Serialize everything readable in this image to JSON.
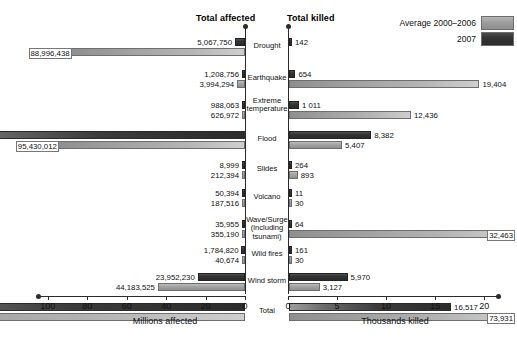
{
  "headers": {
    "affected": "Total affected",
    "killed": "Total killed"
  },
  "legend": {
    "position": "top-right",
    "items": [
      {
        "label": "Average 2000–2006",
        "key": "avg",
        "color": "#9d9d9d"
      },
      {
        "label": "2007",
        "key": "y2007",
        "color": "#333333"
      }
    ]
  },
  "axes": {
    "left": {
      "title": "Millions affected",
      "ticks": [
        "100",
        "80",
        "60",
        "40",
        "20",
        "0"
      ],
      "tick_values": [
        100,
        80,
        60,
        40,
        20,
        0
      ],
      "max": 105,
      "direction": "right-to-left"
    },
    "right": {
      "title": "Thousands killed",
      "ticks": [
        "0",
        "5",
        "10",
        "15",
        "20"
      ],
      "tick_values": [
        0,
        5,
        10,
        15,
        20
      ],
      "max": 21.5,
      "direction": "left-to-right"
    }
  },
  "chart_data": {
    "type": "bar",
    "orientation": "horizontal-bidirectional",
    "categories": [
      "Drought",
      "Earthquake",
      "Extreme temperature",
      "Flood",
      "Slides",
      "Volcano",
      "Wave/Surge (including tsunami)",
      "Wild fires",
      "Wind storm",
      "Total"
    ],
    "panels": [
      {
        "name": "Total affected",
        "xlabel": "Millions affected",
        "unit": "people",
        "xlim": [
          0,
          105
        ],
        "axis_unit_scale": 1000000,
        "series": [
          {
            "name": "2007",
            "key": "y2007",
            "values": [
              5067750,
              1208756,
              988063,
              164662775,
              8999,
              50394,
              35955,
              1784820,
              23952230,
              197760311
            ],
            "labels": [
              "5,067,750",
              "1,208,756",
              "988,063",
              "164,662,775",
              "8,999",
              "50,394",
              "35,955",
              "1,784,820",
              "23,952,230",
              "197,760,311"
            ]
          },
          {
            "name": "Average 2000–2006",
            "key": "avg",
            "values": [
              88996438,
              3994294,
              626972,
              95430012,
              212394,
              187516,
              355190,
              40674,
              44183525,
              234027013
            ],
            "labels": [
              "88,996,438",
              "3,994,294",
              "626,972",
              "95,430,012",
              "212,394",
              "187,516",
              "355,190",
              "40,674",
              "44,183,525",
              "234 027 013"
            ]
          }
        ]
      },
      {
        "name": "Total killed",
        "xlabel": "Thousands killed",
        "unit": "people",
        "xlim": [
          0,
          21.5
        ],
        "axis_unit_scale": 1000,
        "series": [
          {
            "name": "2007",
            "key": "y2007",
            "values": [
              142,
              654,
              1011,
              8382,
              264,
              11,
              64,
              161,
              5970,
              16517
            ],
            "labels": [
              "142",
              "654",
              "1 011",
              "8,382",
              "264",
              "11",
              "64",
              "161",
              "5,970",
              "16,517"
            ]
          },
          {
            "name": "Average 2000–2006",
            "key": "avg",
            "values": [
              0,
              19404,
              12436,
              5407,
              893,
              30,
              32463,
              30,
              3127,
              73931
            ],
            "labels": [
              "",
              "19,404",
              "12,436",
              "5,407",
              "893",
              "30",
              "32,463",
              "30",
              "3,127",
              "73,931"
            ]
          }
        ]
      }
    ]
  }
}
